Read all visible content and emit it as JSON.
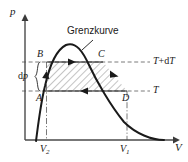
{
  "figure": {
    "type": "thermodynamic-pv-diagram",
    "axes": {
      "y_label": "p",
      "x_label": "V"
    },
    "curve_label": "Grenzkurve",
    "cycle_points": [
      {
        "id": "A",
        "label": "A"
      },
      {
        "id": "B",
        "label": "B"
      },
      {
        "id": "C",
        "label": "C"
      },
      {
        "id": "D",
        "label": "D"
      }
    ],
    "isotherms": [
      {
        "id": "upper",
        "label_prefix": "T",
        "label_plus": "+",
        "label_suffix": "dT",
        "label_full": "T+dT"
      },
      {
        "id": "lower",
        "label_prefix": "T",
        "label_plus": "",
        "label_suffix": "",
        "label_full": "T"
      }
    ],
    "pressure_difference": {
      "label_d": "d",
      "label_p": "p",
      "label_full": "dp"
    },
    "volume_ticks": [
      {
        "id": "V2",
        "base": "V",
        "sub": "2"
      },
      {
        "id": "V1",
        "base": "V",
        "sub": "1"
      }
    ],
    "colors": {
      "stroke": "#1a1a1a",
      "axis": "#4a4a4a",
      "dashed": "#6b6b6b",
      "hatch": "#555555",
      "background": "#ffffff"
    }
  }
}
